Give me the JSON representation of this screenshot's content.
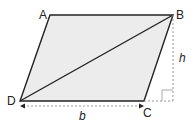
{
  "diagram": {
    "vertices": {
      "A": {
        "label": "A",
        "x": 50,
        "y": 15
      },
      "B": {
        "label": "B",
        "x": 173,
        "y": 15
      },
      "C": {
        "label": "C",
        "x": 144,
        "y": 101
      },
      "D": {
        "label": "D",
        "x": 20,
        "y": 101
      }
    },
    "base_label": "b",
    "height_label": "h",
    "fill_color": "#ececec",
    "stroke_color": "#222222",
    "dash_color": "#999999"
  }
}
